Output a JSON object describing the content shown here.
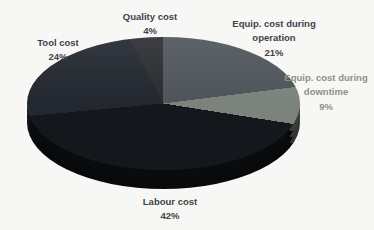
{
  "chart_data": {
    "type": "pie",
    "style": "3d",
    "title": "",
    "legend": "none",
    "labels_position": "outside with category name and percentage",
    "start_angle_deg": 0,
    "direction": "clockwise",
    "slices": [
      {
        "label": "Equip. cost during operation",
        "value": 21,
        "pct_label": "21%",
        "color": "#4f555a",
        "label_color": "#404346"
      },
      {
        "label": "Equip. cost during downtime",
        "value": 9,
        "pct_label": "9%",
        "color": "#7c837c",
        "label_color": "#8d9286"
      },
      {
        "label": "Labour cost",
        "value": 42,
        "pct_label": "42%",
        "color": "#15171c",
        "label_color": "#404346"
      },
      {
        "label": "Tool cost",
        "value": 24,
        "pct_label": "24%",
        "color": "#232830",
        "label_color": "#404346"
      },
      {
        "label": "Quality cost",
        "value": 4,
        "pct_label": "4%",
        "color": "#2b2d31",
        "label_color": "#404346"
      }
    ]
  },
  "labels": {
    "quality": {
      "name": "Quality cost",
      "pct": "4%"
    },
    "operation": {
      "name": "Equip. cost during operation",
      "pct": "21%"
    },
    "downtime": {
      "name": "Equip. cost during downtime",
      "pct": "9%"
    },
    "labour": {
      "name": "Labour cost",
      "pct": "42%"
    },
    "tool": {
      "name": "Tool cost",
      "pct": "24%"
    }
  },
  "colors": {
    "background": "#f7f7f5",
    "dark_label": "#404346",
    "downtime_label": "#8d9286"
  }
}
